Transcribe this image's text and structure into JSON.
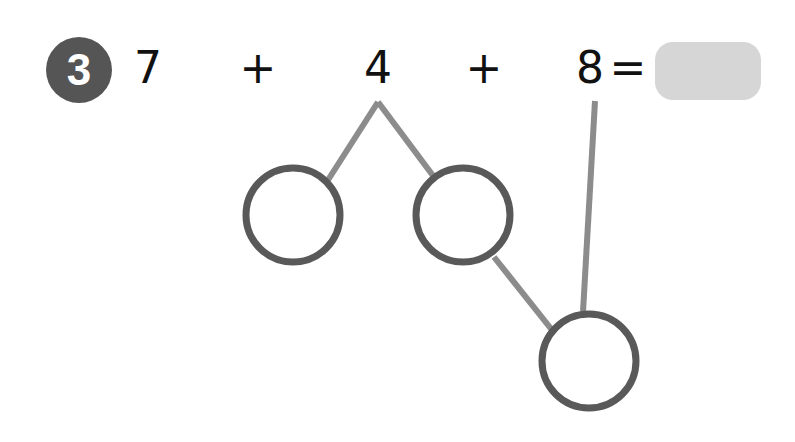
{
  "problem": {
    "number": "3",
    "terms": [
      "7",
      "4",
      "8"
    ],
    "operators": [
      "+",
      "+"
    ],
    "equals": "=",
    "answer_value": ""
  },
  "colors": {
    "badge": "#555555",
    "circle_stroke": "#595959",
    "line_stroke": "#8c8c8c",
    "answer_box": "#d6d6d6"
  },
  "number_bond": {
    "circles": [
      {
        "name": "left-blank",
        "cx": 293,
        "cy": 215,
        "r": 46,
        "value": ""
      },
      {
        "name": "middle-blank",
        "cx": 463,
        "cy": 215,
        "r": 46,
        "value": ""
      },
      {
        "name": "bottom-blank",
        "cx": 589,
        "cy": 361,
        "r": 46,
        "value": ""
      }
    ]
  }
}
